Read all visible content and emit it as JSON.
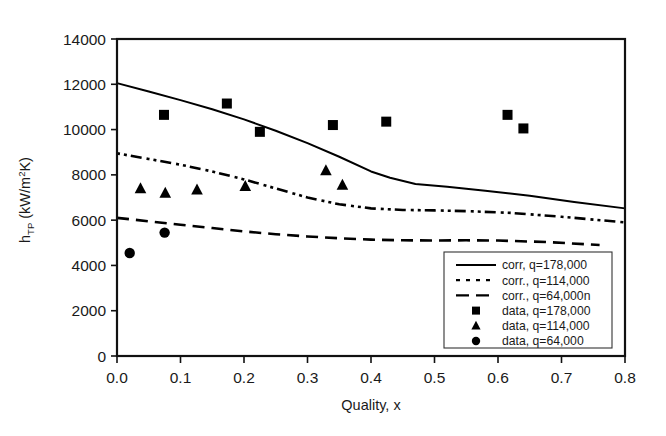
{
  "chart_data": {
    "type": "scatter",
    "title": "",
    "xlabel": "Quality, x",
    "ylabel": "h_TP (kW/m2K)",
    "ylabel_parts": {
      "base": "h",
      "subscript": "TP",
      "units_pre": " (kW/m",
      "units_sup": "2",
      "units_post": "K)"
    },
    "xlim": [
      0.0,
      0.8
    ],
    "ylim": [
      0,
      14000
    ],
    "xticks": [
      "0.0",
      "0.1",
      "0.2",
      "0.3",
      "0.4",
      "0.5",
      "0.6",
      "0.7",
      "0.8"
    ],
    "xtick_values": [
      0.0,
      0.1,
      0.2,
      0.3,
      0.4,
      0.5,
      0.6,
      0.7,
      0.8
    ],
    "yticks": [
      "0",
      "2000",
      "4000",
      "6000",
      "8000",
      "10000",
      "12000",
      "14000"
    ],
    "ytick_values": [
      0,
      2000,
      4000,
      6000,
      8000,
      10000,
      12000,
      14000
    ],
    "grid": false,
    "legend_position": "lower-right-inside",
    "series": [
      {
        "name": "corr, q=178,000",
        "kind": "line",
        "style": "solid",
        "color": "#000000",
        "x": [
          0.0,
          0.05,
          0.1,
          0.15,
          0.2,
          0.25,
          0.3,
          0.35,
          0.4,
          0.43,
          0.47,
          0.52,
          0.58,
          0.65,
          0.72,
          0.8
        ],
        "y": [
          12050,
          11680,
          11300,
          10900,
          10450,
          9950,
          9400,
          8800,
          8150,
          7870,
          7600,
          7480,
          7300,
          7080,
          6800,
          6520
        ]
      },
      {
        "name": "corr., q=114,000",
        "kind": "line",
        "style": "dash-dot",
        "color": "#000000",
        "x": [
          0.0,
          0.05,
          0.1,
          0.15,
          0.2,
          0.25,
          0.3,
          0.35,
          0.4,
          0.45,
          0.5,
          0.55,
          0.62,
          0.7,
          0.8
        ],
        "y": [
          8950,
          8700,
          8450,
          8150,
          7800,
          7400,
          7000,
          6700,
          6520,
          6450,
          6430,
          6400,
          6320,
          6150,
          5900
        ]
      },
      {
        "name": "corr., q=64,000n",
        "kind": "line",
        "style": "dashed",
        "color": "#000000",
        "x": [
          0.0,
          0.05,
          0.1,
          0.15,
          0.2,
          0.25,
          0.3,
          0.35,
          0.4,
          0.45,
          0.5,
          0.55,
          0.6,
          0.68,
          0.76
        ],
        "y": [
          6100,
          5950,
          5800,
          5650,
          5500,
          5380,
          5280,
          5200,
          5140,
          5110,
          5100,
          5110,
          5100,
          5030,
          4900
        ]
      },
      {
        "name": "data, q=178,000",
        "kind": "scatter",
        "marker": "square",
        "color": "#000000",
        "x": [
          0.074,
          0.173,
          0.225,
          0.34,
          0.424,
          0.615,
          0.64
        ],
        "y": [
          10650,
          11150,
          9900,
          10200,
          10350,
          10650,
          10050
        ]
      },
      {
        "name": "data, q=114,000",
        "kind": "scatter",
        "marker": "triangle",
        "color": "#000000",
        "x": [
          0.037,
          0.076,
          0.126,
          0.202,
          0.329,
          0.355
        ],
        "y": [
          7400,
          7200,
          7350,
          7500,
          8200,
          7550
        ]
      },
      {
        "name": "data, q=64,000",
        "kind": "scatter",
        "marker": "circle",
        "color": "#000000",
        "x": [
          0.02,
          0.075
        ],
        "y": [
          4550,
          5450
        ]
      }
    ],
    "legend_entries": [
      {
        "label": "corr, q=178,000",
        "type": "line",
        "style": "solid"
      },
      {
        "label": "corr., q=114,000",
        "type": "line",
        "style": "dotted"
      },
      {
        "label": "corr., q=64,000n",
        "type": "line",
        "style": "dashed"
      },
      {
        "label": "data, q=178,000",
        "type": "marker",
        "style": "square"
      },
      {
        "label": "data, q=114,000",
        "type": "marker",
        "style": "triangle"
      },
      {
        "label": "data, q=64,000",
        "type": "marker",
        "style": "circle"
      }
    ]
  }
}
